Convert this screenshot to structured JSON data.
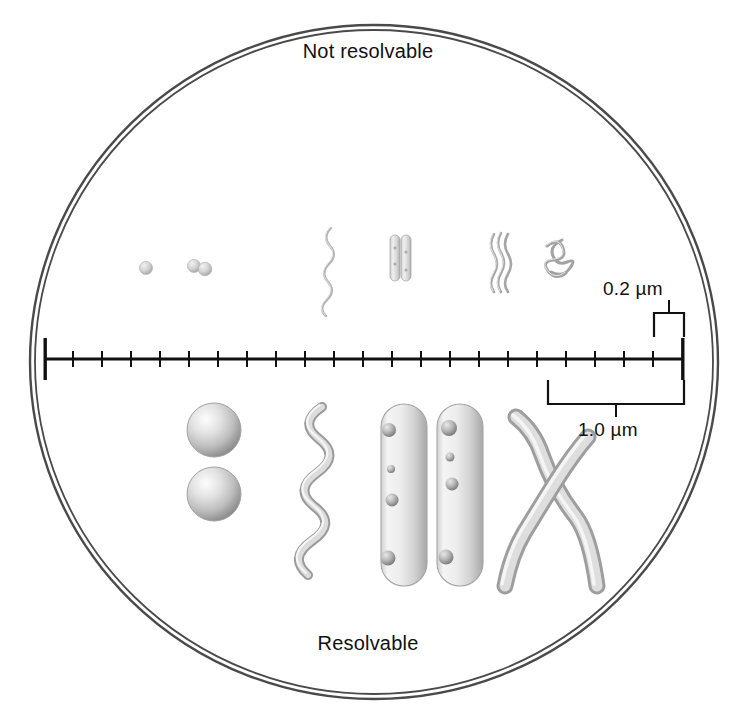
{
  "figure": {
    "title_top": "Not resolvable",
    "title_bottom": "Resolvable",
    "field_shape": "circle",
    "border_color": "#3a3a3a",
    "background_color": "#ffffff"
  },
  "scale_bar": {
    "axis_color": "#111111",
    "tick_count": 22,
    "tick_interval_um": 0.2,
    "total_length_um": 4.4,
    "labels": {
      "small": "0.2 µm",
      "large": "1.0 µm"
    }
  },
  "specimens_small": [
    {
      "name": "coccus-small",
      "shape": "sphere",
      "label": "coccus"
    },
    {
      "name": "diplococcus-small",
      "shape": "sphere-pair",
      "label": "diplococcus"
    },
    {
      "name": "spirochete-small",
      "shape": "wave",
      "label": "spirochete"
    },
    {
      "name": "bacilli-small",
      "shape": "rod-pair",
      "label": "bacilli"
    },
    {
      "name": "spirillum-small",
      "shape": "wave-cluster",
      "label": "spirillum"
    },
    {
      "name": "filament-small",
      "shape": "tangle",
      "label": "filament"
    }
  ],
  "specimens_large": [
    {
      "name": "coccus-large-top",
      "shape": "sphere",
      "label": "coccus"
    },
    {
      "name": "coccus-large-bottom",
      "shape": "sphere",
      "label": "coccus"
    },
    {
      "name": "spirochete-large",
      "shape": "corkscrew",
      "label": "spirochete"
    },
    {
      "name": "bacillus-large-left",
      "shape": "rod",
      "label": "bacillus"
    },
    {
      "name": "bacillus-large-right",
      "shape": "rod",
      "label": "bacillus"
    },
    {
      "name": "filament-large",
      "shape": "crossed-filaments",
      "label": "filaments"
    }
  ],
  "colors": {
    "ink": "#111111",
    "specimen_light": "#f2f2f2",
    "specimen_mid": "#c8c8c8",
    "specimen_dark": "#8d8d8d",
    "specimen_outline": "#9a9a9a"
  }
}
